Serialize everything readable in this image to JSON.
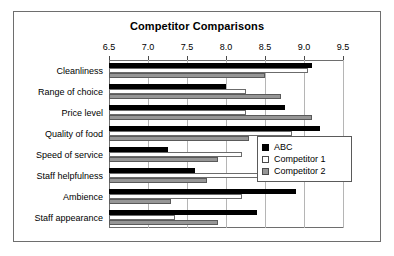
{
  "chart_data": {
    "type": "bar",
    "orientation": "horizontal",
    "title": "Competitor Comparisons",
    "xlabel": "",
    "ylabel": "",
    "xlim": [
      6.5,
      9.5
    ],
    "xticks": [
      6.5,
      7.0,
      7.5,
      8.0,
      8.5,
      9.0,
      9.5
    ],
    "xtick_labels": [
      "6.5",
      "7.0",
      "7.5",
      "8.0",
      "8.5",
      "9.0",
      "9.5"
    ],
    "grid": true,
    "legend_position": "center-right",
    "categories": [
      "Cleanliness",
      "Range of choice",
      "Price level",
      "Quality of food",
      "Speed of service",
      "Staff helpfulness",
      "Ambience",
      "Staff appearance"
    ],
    "series": [
      {
        "name": "ABC",
        "color": "#000000",
        "values": [
          9.1,
          8.0,
          8.75,
          9.2,
          7.25,
          7.6,
          8.9,
          8.4
        ]
      },
      {
        "name": "Competitor 1",
        "color": "#ffffff",
        "values": [
          9.05,
          8.25,
          8.25,
          8.85,
          8.2,
          9.05,
          8.2,
          7.35
        ]
      },
      {
        "name": "Competitor 2",
        "color": "#969696",
        "values": [
          8.5,
          8.7,
          9.1,
          8.3,
          7.9,
          7.75,
          7.3,
          7.9
        ]
      }
    ]
  },
  "legend": {
    "entries": [
      {
        "label": "ABC"
      },
      {
        "label": "Competitor 1"
      },
      {
        "label": "Competitor 2"
      }
    ]
  }
}
